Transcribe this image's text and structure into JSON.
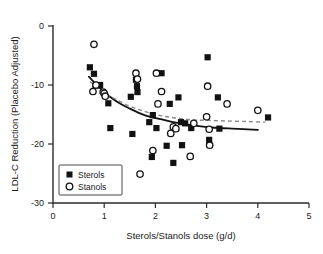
{
  "chart_data": {
    "type": "scatter",
    "title": "",
    "xlabel": "Sterols/Stanols dose (g/d)",
    "ylabel": "LDL-C Reduction (Placebo Adjusted)",
    "xlim": [
      0,
      5
    ],
    "ylim": [
      -30,
      0
    ],
    "xticks": [
      0,
      1,
      2,
      3,
      4,
      5
    ],
    "yticks": [
      0,
      -10,
      -20,
      -30
    ],
    "xtick_labels": [
      "0",
      "1",
      "2",
      "3",
      "4",
      "5"
    ],
    "ytick_labels": [
      "0",
      "-10",
      "-20",
      "-30"
    ],
    "grid": false,
    "legend_position": "lower-left",
    "series": [
      {
        "name": "Sterols",
        "marker": "filled-square",
        "color": "#111111",
        "points": [
          [
            0.72,
            -7.0
          ],
          [
            0.8,
            -8.1
          ],
          [
            0.83,
            -10.1
          ],
          [
            0.92,
            -10.0
          ],
          [
            1.08,
            -13.1
          ],
          [
            1.12,
            -17.3
          ],
          [
            1.52,
            -12.0
          ],
          [
            1.55,
            -18.3
          ],
          [
            1.62,
            -9.1
          ],
          [
            1.64,
            -10.2
          ],
          [
            1.65,
            -11.2
          ],
          [
            1.88,
            -16.3
          ],
          [
            1.93,
            -22.2
          ],
          [
            1.95,
            -15.1
          ],
          [
            2.02,
            -17.3
          ],
          [
            2.12,
            -8.0
          ],
          [
            2.22,
            -20.3
          ],
          [
            2.28,
            -13.2
          ],
          [
            2.35,
            -23.2
          ],
          [
            2.45,
            -12.1
          ],
          [
            2.5,
            -16.3
          ],
          [
            2.52,
            -20.2
          ],
          [
            2.58,
            -16.5
          ],
          [
            2.7,
            -17.3
          ],
          [
            3.02,
            -5.3
          ],
          [
            3.05,
            -19.3
          ],
          [
            3.22,
            -12.1
          ],
          [
            3.25,
            -17.4
          ],
          [
            4.2,
            -15.5
          ]
        ]
      },
      {
        "name": "Stanols",
        "marker": "open-circle",
        "color": "#111111",
        "points": [
          [
            0.8,
            -3.1
          ],
          [
            0.78,
            -11.1
          ],
          [
            0.84,
            -10.0
          ],
          [
            0.98,
            -11.2
          ],
          [
            1.0,
            -11.4
          ],
          [
            1.02,
            -11.9
          ],
          [
            1.62,
            -8.0
          ],
          [
            1.65,
            -9.0
          ],
          [
            1.7,
            -25.1
          ],
          [
            1.95,
            -21.1
          ],
          [
            2.02,
            -8.0
          ],
          [
            2.05,
            -13.2
          ],
          [
            2.12,
            -11.1
          ],
          [
            2.3,
            -18.2
          ],
          [
            2.35,
            -17.1
          ],
          [
            2.4,
            -17.4
          ],
          [
            2.68,
            -22.1
          ],
          [
            2.75,
            -16.5
          ],
          [
            3.0,
            -15.4
          ],
          [
            3.02,
            -10.2
          ],
          [
            3.05,
            -17.5
          ],
          [
            3.06,
            -20.2
          ],
          [
            3.4,
            -13.2
          ],
          [
            4.0,
            -14.3
          ]
        ]
      }
    ],
    "fit_lines": [
      {
        "name": "Sterols fit",
        "style": "solid",
        "color": "#111111",
        "points": [
          [
            0.7,
            -8.6
          ],
          [
            0.9,
            -10.4
          ],
          [
            1.1,
            -11.9
          ],
          [
            1.3,
            -13.1
          ],
          [
            1.5,
            -14.0
          ],
          [
            1.7,
            -14.8
          ],
          [
            1.9,
            -15.4
          ],
          [
            2.1,
            -15.8
          ],
          [
            2.3,
            -16.2
          ],
          [
            2.5,
            -16.5
          ],
          [
            2.8,
            -16.9
          ],
          [
            3.1,
            -17.2
          ],
          [
            3.5,
            -17.4
          ],
          [
            4.0,
            -17.6
          ]
        ]
      },
      {
        "name": "Stanols fit",
        "style": "dashed",
        "color": "#8a8a8a",
        "points": [
          [
            0.72,
            -9.4
          ],
          [
            0.95,
            -11.0
          ],
          [
            1.2,
            -12.3
          ],
          [
            1.5,
            -13.6
          ],
          [
            1.8,
            -14.5
          ],
          [
            2.1,
            -15.2
          ],
          [
            2.4,
            -15.6
          ],
          [
            2.7,
            -15.9
          ],
          [
            3.0,
            -16.0
          ],
          [
            3.4,
            -16.1
          ],
          [
            3.8,
            -16.2
          ],
          [
            4.15,
            -16.3
          ]
        ]
      }
    ],
    "legend": [
      {
        "label": "Sterols",
        "marker": "filled-square"
      },
      {
        "label": "Stanols",
        "marker": "open-circle"
      }
    ]
  }
}
